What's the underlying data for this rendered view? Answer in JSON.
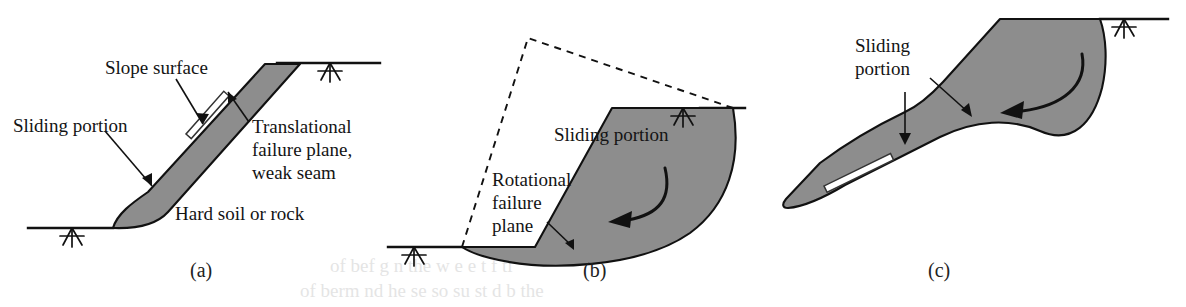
{
  "figure": {
    "type": "technical-diagram",
    "background_color": "#ffffff",
    "mass_fill_color": "#8d8d8d",
    "line_color": "#111111",
    "seam_color": "#ffffff"
  },
  "panels": [
    {
      "id": "a",
      "caption": "(a)",
      "failure_type": "translational",
      "labels": {
        "slope_surface": "Slope surface",
        "sliding_portion": "Sliding portion",
        "failure_plane_line1": "Translational",
        "failure_plane_line2": "failure plane,",
        "failure_plane_line3": "weak seam",
        "substrate": "Hard soil or rock"
      }
    },
    {
      "id": "b",
      "caption": "(b)",
      "failure_type": "rotational",
      "labels": {
        "sliding_portion": "Sliding portion",
        "failure_plane_line1": "Rotational",
        "failure_plane_line2": "failure",
        "failure_plane_line3": "plane"
      }
    },
    {
      "id": "c",
      "caption": "(c)",
      "failure_type": "compound",
      "labels": {
        "sliding_portion_line1": "Sliding",
        "sliding_portion_line2": "portion"
      }
    }
  ],
  "bleed_through": {
    "line1": "of   bef   g  n  the   w  e   e    t   f   ti",
    "line2": "of  berm    nd   he   se   so  su  st d   b   the"
  }
}
